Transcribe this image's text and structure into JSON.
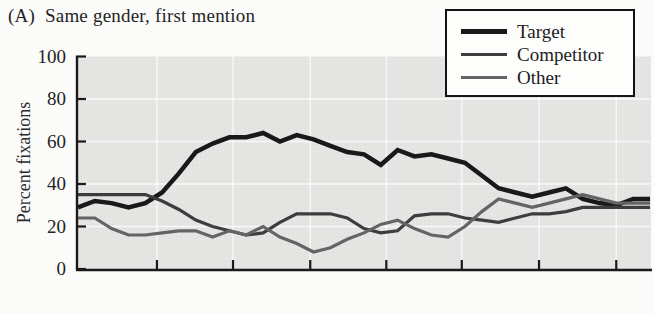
{
  "header": {
    "panel_label": "(A)",
    "title": "Same gender, first mention"
  },
  "chart_data": {
    "type": "line",
    "xlabel": "",
    "ylabel": "Percent fixations",
    "ylim": [
      0,
      100
    ],
    "yticks": [
      0,
      20,
      40,
      60,
      80,
      100
    ],
    "x_ticks_unlabeled_percent": [
      13.8,
      27.1,
      40.6,
      53.9,
      67.1,
      80.6,
      94.1
    ],
    "grid": true,
    "legend_position": "top-right",
    "plot_bg": "#e5e5e4",
    "grid_color": "#ffffff",
    "axis_color": "#1a1a1a",
    "x": [
      0,
      1,
      2,
      3,
      4,
      5,
      6,
      7,
      8,
      9,
      10,
      11,
      12,
      13,
      14,
      15,
      16,
      17,
      18,
      19,
      20,
      21,
      22,
      23,
      24,
      25,
      26,
      27,
      28,
      29,
      30,
      31,
      32,
      33,
      34
    ],
    "series": [
      {
        "name": "Target",
        "color": "#191919",
        "width": 4.5,
        "values": [
          29,
          32,
          31,
          29,
          31,
          36,
          45,
          55,
          59,
          62,
          62,
          64,
          60,
          63,
          61,
          58,
          55,
          54,
          49,
          56,
          53,
          54,
          52,
          50,
          44,
          38,
          36,
          34,
          36,
          38,
          33,
          31,
          30,
          33,
          33
        ]
      },
      {
        "name": "Competitor",
        "color": "#3d3d3d",
        "width": 3.2,
        "values": [
          35,
          35,
          35,
          35,
          35,
          32,
          28,
          23,
          20,
          18,
          16,
          17,
          22,
          26,
          26,
          26,
          24,
          19,
          17,
          18,
          25,
          26,
          26,
          24,
          23,
          22,
          24,
          26,
          26,
          27,
          29,
          29,
          29,
          29,
          29
        ]
      },
      {
        "name": "Other",
        "color": "#646464",
        "width": 3.2,
        "values": [
          24,
          24,
          19,
          16,
          16,
          17,
          18,
          18,
          15,
          18,
          16,
          20,
          15,
          12,
          8,
          10,
          14,
          17,
          21,
          23,
          19,
          16,
          15,
          20,
          27,
          33,
          31,
          29,
          31,
          33,
          35,
          33,
          31,
          31,
          31
        ]
      }
    ]
  }
}
